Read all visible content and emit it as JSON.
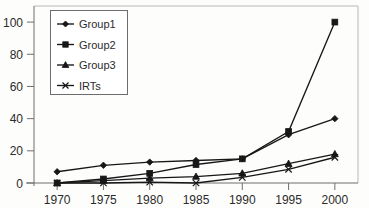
{
  "chart_data": {
    "type": "line",
    "title": "",
    "xlabel": "",
    "ylabel": "",
    "categories": [
      "1970",
      "1975",
      "1980",
      "1985",
      "1990",
      "1995",
      "2000"
    ],
    "x": [
      1970,
      1975,
      1980,
      1985,
      1990,
      1995,
      2000
    ],
    "ylim": [
      0,
      110
    ],
    "xlim": [
      1967.5,
      2002.5
    ],
    "yticks": [
      0,
      20,
      40,
      60,
      80,
      100
    ],
    "ytick_labels": [
      "0",
      "20",
      "40",
      "60",
      "80",
      "100"
    ],
    "xtick_labels": [
      "1970",
      "1975",
      "1980",
      "1985",
      "1990",
      "1995",
      "2000"
    ],
    "grid": false,
    "legend_position": "upper-left-inside",
    "series": [
      {
        "name": "Group1",
        "marker": "diamond",
        "color": "#171717",
        "values": [
          7,
          11,
          13,
          14,
          15,
          30,
          40
        ]
      },
      {
        "name": "Group2",
        "marker": "square",
        "color": "#171717",
        "values": [
          0,
          2.5,
          6,
          11.5,
          15,
          32,
          100
        ]
      },
      {
        "name": "Group3",
        "marker": "triangle",
        "color": "#171717",
        "values": [
          0,
          1.5,
          3,
          4,
          6,
          12,
          18
        ]
      },
      {
        "name": "IRTs",
        "marker": "x",
        "color": "#171717",
        "values": [
          0,
          0,
          0.5,
          0,
          3.5,
          8.5,
          16
        ]
      }
    ]
  },
  "legend": {
    "items": [
      {
        "label": "Group1",
        "marker": "diamond"
      },
      {
        "label": "Group2",
        "marker": "square"
      },
      {
        "label": "Group3",
        "marker": "triangle"
      },
      {
        "label": "IRTs",
        "marker": "x"
      }
    ]
  }
}
